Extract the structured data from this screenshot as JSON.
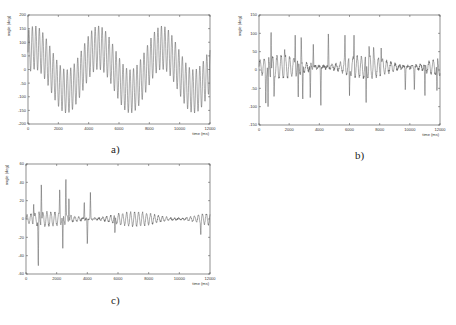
{
  "chart_data": [
    {
      "id": "a",
      "type": "line",
      "caption": "a)",
      "title": "",
      "xlabel": "time (ms)",
      "ylabel": "angle (deg)",
      "xlim": [
        0,
        12000
      ],
      "ylim": [
        -200,
        200
      ],
      "xticks": [
        0,
        2000,
        4000,
        6000,
        8000,
        10000,
        12000
      ],
      "yticks": [
        -200,
        -150,
        -100,
        -50,
        0,
        50,
        100,
        150,
        200
      ],
      "grid": false,
      "legend": null,
      "series": [
        {
          "name": "angle",
          "description": "Superposition of slow sinusoid (~4000 ms period, amplitude ~80 deg) and fast oscillation (~200 ms period, amplitude ~80 deg)",
          "components": [
            {
              "amp": 80,
              "period": 4200,
              "phase": 0.9
            },
            {
              "amp": 80,
              "period": 230,
              "phase": 0
            }
          ],
          "approx_peaks": {
            "max": 175,
            "min": -175
          }
        }
      ]
    },
    {
      "id": "b",
      "type": "line",
      "caption": "b)",
      "title": "",
      "xlabel": "time (ms)",
      "ylabel": "angle (deg)",
      "xlim": [
        0,
        12000
      ],
      "ylim": [
        -150,
        150
      ],
      "xticks": [
        0,
        2000,
        4000,
        6000,
        8000,
        10000,
        12000
      ],
      "yticks": [
        -150,
        -100,
        -50,
        0,
        50,
        100,
        150
      ],
      "grid": false,
      "legend": null,
      "series": [
        {
          "name": "angle",
          "description": "Irregular oscillation around ~0-10 deg with sharp spikes",
          "base_amp": 28,
          "base_period": 280,
          "spikes": [
            {
              "t": 450,
              "v": -105
            },
            {
              "t": 600,
              "v": -100
            },
            {
              "t": 800,
              "v": 115
            },
            {
              "t": 1000,
              "v": -80
            },
            {
              "t": 1700,
              "v": 60
            },
            {
              "t": 2400,
              "v": 95
            },
            {
              "t": 2600,
              "v": -85
            },
            {
              "t": 2800,
              "v": 98
            },
            {
              "t": 2900,
              "v": -90
            },
            {
              "t": 3400,
              "v": -85
            },
            {
              "t": 3600,
              "v": 70
            },
            {
              "t": 4100,
              "v": -108
            },
            {
              "t": 4600,
              "v": 108
            },
            {
              "t": 5700,
              "v": 95
            },
            {
              "t": 6000,
              "v": -70
            },
            {
              "t": 6300,
              "v": 95
            },
            {
              "t": 7100,
              "v": -102
            },
            {
              "t": 7300,
              "v": 70
            },
            {
              "t": 7600,
              "v": 65
            },
            {
              "t": 8100,
              "v": 60
            },
            {
              "t": 9700,
              "v": -60
            },
            {
              "t": 10300,
              "v": -60
            },
            {
              "t": 11000,
              "v": -80
            },
            {
              "t": 11800,
              "v": -65
            }
          ],
          "approx_peaks": {
            "max": 115,
            "min": -108
          }
        }
      ]
    },
    {
      "id": "c",
      "type": "line",
      "caption": "c)",
      "title": "",
      "xlabel": "time (ms)",
      "ylabel": "angle (deg)",
      "xlim": [
        0,
        12000
      ],
      "ylim": [
        -60,
        60
      ],
      "xticks": [
        0,
        2000,
        4000,
        6000,
        8000,
        10000,
        12000
      ],
      "yticks": [
        -60,
        -40,
        -20,
        0,
        20,
        40,
        60
      ],
      "grid": false,
      "legend": null,
      "series": [
        {
          "name": "angle",
          "description": "Small oscillation around 0 (+/-8 deg) with large early spikes",
          "base_amp": 7,
          "base_period": 260,
          "spikes": [
            {
              "t": 500,
              "v": 18
            },
            {
              "t": 800,
              "v": -57
            },
            {
              "t": 1000,
              "v": 42
            },
            {
              "t": 2200,
              "v": 35
            },
            {
              "t": 2400,
              "v": -32
            },
            {
              "t": 2600,
              "v": 48
            },
            {
              "t": 2800,
              "v": 25
            },
            {
              "t": 3800,
              "v": 20
            },
            {
              "t": 4000,
              "v": -30
            },
            {
              "t": 4200,
              "v": 29
            },
            {
              "t": 5800,
              "v": -17
            },
            {
              "t": 11400,
              "v": -17
            }
          ],
          "approx_peaks": {
            "max": 48,
            "min": -57
          }
        }
      ]
    }
  ],
  "captions": {
    "a": "a)",
    "b": "b)",
    "c": "c)"
  },
  "axis": {
    "xlabel": "time (ms)",
    "ylabel": "angle (deg)"
  }
}
